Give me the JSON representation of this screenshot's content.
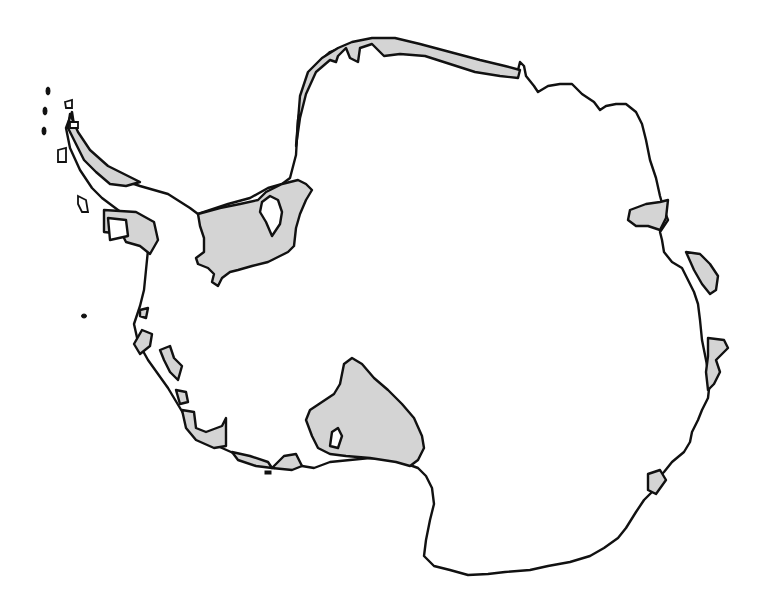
{
  "map": {
    "subject": "Antarctica",
    "legend": [],
    "colors": {
      "background": "#ffffff",
      "land": "#ffffff",
      "ice_shelf": "#d4d4d4",
      "outline": "#111111"
    },
    "regions": [
      {
        "id": "antarctic-peninsula-shelves",
        "kind": "ice_shelf"
      },
      {
        "id": "ronne-filchner-shelf",
        "kind": "ice_shelf"
      },
      {
        "id": "ross-shelf",
        "kind": "ice_shelf"
      },
      {
        "id": "queen-maud-land-coast-shelf",
        "kind": "ice_shelf"
      },
      {
        "id": "amery-shelf",
        "kind": "ice_shelf"
      },
      {
        "id": "east-coast-shelves",
        "kind": "ice_shelf"
      },
      {
        "id": "west-antarctic-coast-shelves",
        "kind": "ice_shelf"
      }
    ]
  }
}
